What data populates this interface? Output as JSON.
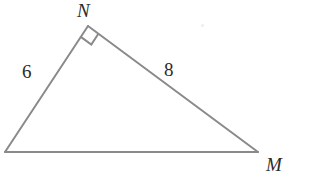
{
  "figure": {
    "background_color": "#ffffff",
    "stroke_color": "#8a8a8a",
    "stroke_width": 2,
    "label_color": "#2b2b2b",
    "width": 316,
    "height": 172
  },
  "vertices": {
    "apex": {
      "name": "N",
      "label": "N",
      "x": 88,
      "y": 26
    },
    "left": {
      "name": "L",
      "label": "",
      "x": 5,
      "y": 152
    },
    "right": {
      "name": "M",
      "label": "M",
      "x": 258,
      "y": 152
    }
  },
  "side_labels": {
    "left_leg": "6",
    "right_leg": "8",
    "base": ""
  },
  "right_angle": {
    "at_vertex": "N",
    "marker": "square",
    "size": 13
  },
  "chart_data": {
    "type": "diagram",
    "shape": "right-triangle",
    "points": [
      {
        "id": "N",
        "x": 88,
        "y": 26,
        "label": "N"
      },
      {
        "id": "L",
        "x": 5,
        "y": 152,
        "label": ""
      },
      {
        "id": "M",
        "x": 258,
        "y": 152,
        "label": "M"
      }
    ],
    "edges": [
      {
        "from": "L",
        "to": "N",
        "label": "6"
      },
      {
        "from": "N",
        "to": "M",
        "label": "8"
      },
      {
        "from": "L",
        "to": "M",
        "label": ""
      }
    ],
    "annotations": [
      {
        "type": "right-angle",
        "vertex": "N"
      }
    ]
  }
}
